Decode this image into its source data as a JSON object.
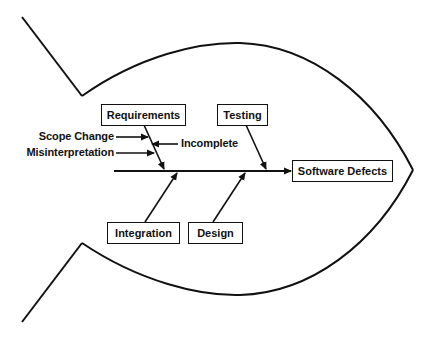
{
  "diagram": {
    "type": "fishbone",
    "effect": "Software Defects",
    "causes": [
      {
        "label": "Requirements",
        "side": "top",
        "sub_causes": [
          "Scope Change",
          "Misinterpretation",
          "Incomplete"
        ]
      },
      {
        "label": "Testing",
        "side": "top",
        "sub_causes": []
      },
      {
        "label": "Integration",
        "side": "bottom",
        "sub_causes": []
      },
      {
        "label": "Design",
        "side": "bottom",
        "sub_causes": []
      }
    ],
    "colors": {
      "line": "#111111",
      "background": "#ffffff",
      "text": "#111111"
    }
  },
  "labels": {
    "effect": "Software Defects",
    "requirements": "Requirements",
    "testing": "Testing",
    "integration": "Integration",
    "design": "Design",
    "scope_change": "Scope Change",
    "misinterpretation": "Misinterpretation",
    "incomplete": "Incomplete"
  }
}
